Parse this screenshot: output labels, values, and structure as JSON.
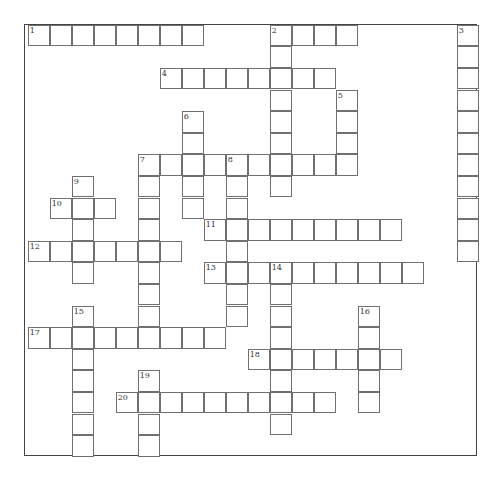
{
  "puzzle": {
    "grid": {
      "origin_x": 27.7,
      "origin_y": 24.7,
      "cell_w": 22,
      "cell_h": 21.6
    },
    "words": [
      {
        "number": "1",
        "dir": "across",
        "row": 0,
        "col": 0,
        "length": 8
      },
      {
        "number": "2",
        "dir": "across",
        "row": 0,
        "col": 11,
        "length": 4
      },
      {
        "number": "2",
        "dir": "down",
        "row": 0,
        "col": 11,
        "length": 8
      },
      {
        "number": "3",
        "dir": "down",
        "row": 0,
        "col": 19.5,
        "length": 11
      },
      {
        "number": "4",
        "dir": "across",
        "row": 2,
        "col": 6,
        "length": 8
      },
      {
        "number": "5",
        "dir": "down",
        "row": 3,
        "col": 14,
        "length": 4
      },
      {
        "number": "6",
        "dir": "down",
        "row": 4,
        "col": 7,
        "length": 5
      },
      {
        "number": "7",
        "dir": "across",
        "row": 6,
        "col": 5,
        "length": 10
      },
      {
        "number": "7",
        "dir": "down",
        "row": 6,
        "col": 5,
        "length": 9
      },
      {
        "number": "8",
        "dir": "down",
        "row": 6,
        "col": 9,
        "length": 8
      },
      {
        "number": "9",
        "dir": "down",
        "row": 7,
        "col": 2,
        "length": 5
      },
      {
        "number": "10",
        "dir": "across",
        "row": 8,
        "col": 1,
        "length": 3
      },
      {
        "number": "11",
        "dir": "across",
        "row": 9,
        "col": 8,
        "length": 9
      },
      {
        "number": "12",
        "dir": "across",
        "row": 10,
        "col": 0,
        "length": 7
      },
      {
        "number": "13",
        "dir": "across",
        "row": 11,
        "col": 8,
        "length": 10
      },
      {
        "number": "14",
        "dir": "down",
        "row": 11,
        "col": 11,
        "length": 8
      },
      {
        "number": "15",
        "dir": "down",
        "row": 13,
        "col": 2,
        "length": 7
      },
      {
        "number": "16",
        "dir": "down",
        "row": 13,
        "col": 15,
        "length": 5
      },
      {
        "number": "17",
        "dir": "across",
        "row": 14,
        "col": 0,
        "length": 9
      },
      {
        "number": "18",
        "dir": "across",
        "row": 15,
        "col": 10,
        "length": 7
      },
      {
        "number": "19",
        "dir": "down",
        "row": 16,
        "col": 5,
        "length": 4
      },
      {
        "number": "20",
        "dir": "across",
        "row": 17,
        "col": 4,
        "length": 10
      }
    ]
  }
}
